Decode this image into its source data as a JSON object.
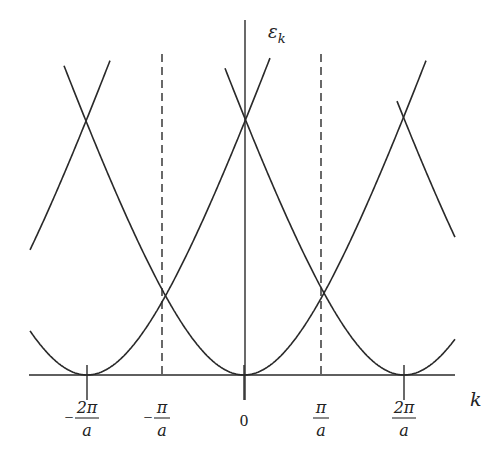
{
  "figure": {
    "y_axis_label": "ε",
    "y_axis_label_sub": "k",
    "x_axis_label": "k",
    "colors": {
      "line": "#2a2a2a",
      "background": "#ffffff"
    }
  },
  "ticks": [
    {
      "id": "minus-2pi-a",
      "x": 87,
      "sign": "−",
      "numerator": "2π",
      "denominator": "a",
      "tick_mark": true
    },
    {
      "id": "minus-pi-a",
      "x": 162,
      "sign": "−",
      "numerator": "π",
      "denominator": "a",
      "tick_mark": false,
      "dashed_boundary": true
    },
    {
      "id": "zero",
      "x": 244,
      "plain": "0",
      "tick_mark": true
    },
    {
      "id": "pi-a",
      "x": 321,
      "sign": "",
      "numerator": "π",
      "denominator": "a",
      "tick_mark": false,
      "dashed_boundary": true
    },
    {
      "id": "2pi-a",
      "x": 404,
      "sign": "",
      "numerator": "2π",
      "denominator": "a",
      "tick_mark": true
    }
  ],
  "geometry": {
    "baseline_y": 375,
    "x_axis": [
      29,
      455
    ],
    "y_axis_x": 245,
    "y_axis_top": 20,
    "y_axis_bottom": 400,
    "dashed_top": 54,
    "curve_A": 292,
    "curve_s": 100
  },
  "curves": [
    {
      "name": "band-center-minus-4pi",
      "center": -72,
      "from": 30,
      "to": 110
    },
    {
      "name": "band-center-minus-2pi",
      "center": 87,
      "from": 30,
      "to": 270
    },
    {
      "name": "band-center-0",
      "center": 244,
      "from": 64,
      "to": 426
    },
    {
      "name": "band-center-2pi",
      "center": 404,
      "from": 225,
      "to": 455
    },
    {
      "name": "band-center-4pi",
      "center": 563,
      "from": 397,
      "to": 455
    }
  ]
}
